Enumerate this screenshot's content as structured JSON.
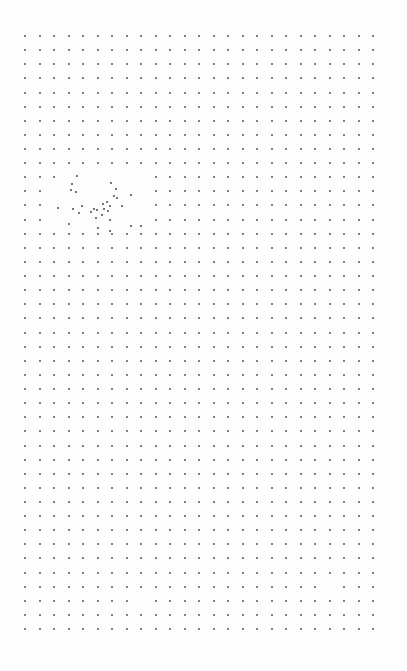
{
  "page": {
    "background": "#fdfdfd",
    "dot_color": "#555555"
  },
  "grid": {
    "rows": 43,
    "cols": 25,
    "origin_x": 25,
    "origin_y": 36,
    "spacing_x": 14.5,
    "spacing_y": 14.12,
    "missing": [
      [
        10,
        3
      ],
      [
        10,
        4
      ],
      [
        10,
        5
      ],
      [
        10,
        6
      ],
      [
        10,
        7
      ],
      [
        10,
        8
      ],
      [
        11,
        2
      ],
      [
        11,
        3
      ],
      [
        11,
        4
      ],
      [
        11,
        5
      ],
      [
        11,
        6
      ],
      [
        11,
        7
      ],
      [
        11,
        8
      ],
      [
        12,
        2
      ],
      [
        12,
        3
      ],
      [
        12,
        4
      ],
      [
        12,
        5
      ],
      [
        12,
        6
      ],
      [
        12,
        7
      ],
      [
        12,
        8
      ],
      [
        13,
        2
      ],
      [
        13,
        3
      ],
      [
        13,
        4
      ],
      [
        13,
        5
      ],
      [
        13,
        6
      ],
      [
        13,
        7
      ],
      [
        13,
        8
      ],
      [
        39,
        21
      ],
      [
        40,
        8
      ]
    ]
  },
  "scattered_dots": [
    [
      77,
      176
    ],
    [
      72,
      184
    ],
    [
      71,
      190
    ],
    [
      76,
      192
    ],
    [
      111,
      183
    ],
    [
      116,
      189
    ],
    [
      114,
      196
    ],
    [
      117,
      198
    ],
    [
      131,
      195
    ],
    [
      82,
      206
    ],
    [
      73,
      209
    ],
    [
      79,
      213
    ],
    [
      58,
      208
    ],
    [
      103,
      204
    ],
    [
      107,
      202
    ],
    [
      110,
      206
    ],
    [
      94,
      209
    ],
    [
      97,
      210
    ],
    [
      91,
      212
    ],
    [
      104,
      209
    ],
    [
      108,
      211
    ],
    [
      102,
      215
    ],
    [
      96,
      218
    ],
    [
      122,
      206
    ],
    [
      110,
      220
    ],
    [
      69,
      224
    ],
    [
      98,
      228
    ],
    [
      131,
      226
    ],
    [
      110,
      231
    ],
    [
      141,
      226
    ]
  ]
}
